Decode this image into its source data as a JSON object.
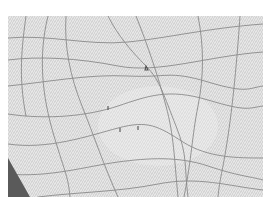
{
  "canvas": {
    "background": "#dcdcdc",
    "line_color": "#8a8a8a",
    "corner_color": "#5a5a5a"
  },
  "grid": {
    "horizontal_lines": [
      "M0,22 C40,18 80,30 120,26 S200,12 255,8",
      "M0,44 C30,40 70,42 110,50 S200,40 255,36",
      "M0,70 C40,66 80,58 120,60 S160,54 200,66 S240,72 255,70",
      "M0,98 C40,104 80,100 110,90 S160,72 200,84 S240,92 255,90",
      "M0,128 C40,134 80,120 110,112 S150,110 175,126 S230,142 255,142",
      "M0,158 C40,162 80,150 110,146 S170,140 200,150 S240,160 255,164",
      "M30,181 C70,176 110,176 150,168 S220,170 255,174"
    ],
    "vertical_lines": [
      "M18,0 C14,30 10,60 18,100",
      "M40,0 C30,40 34,80 46,120 S60,160 62,181",
      "M58,0 C56,30 62,60 74,90 S96,150 110,181",
      "M100,0 C110,20 124,36 138,50 S156,80 168,110 S176,150 180,181",
      "M128,0 C140,30 150,60 158,90 S166,140 170,181",
      "M190,0 C196,30 196,60 190,90 S184,140 176,181",
      "M232,0 C230,30 226,80 220,120 S212,160 210,181"
    ],
    "markers": [
      {
        "name": "marker-a",
        "path": "M138,50 l2,4 l-3,0 z"
      },
      {
        "name": "marker-b",
        "path": "M100,90 l0,4"
      },
      {
        "name": "marker-c",
        "path": "M112,112 l0,4"
      },
      {
        "name": "marker-d",
        "path": "M130,110 l0,4"
      }
    ],
    "corner_triangle": "M0,142 L0,181 L22,181 Z"
  }
}
